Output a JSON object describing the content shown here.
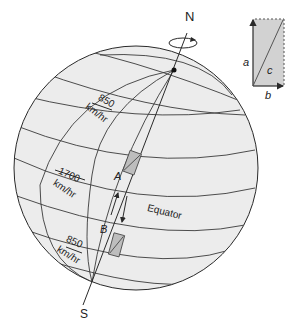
{
  "diagram": {
    "poles": {
      "north": "N",
      "south": "S"
    },
    "equator_label": "Equator",
    "speeds": [
      {
        "value": "850",
        "unit": "km/hr",
        "position": "northern-latitude"
      },
      {
        "value": "1700",
        "unit": "km/hr",
        "position": "equator"
      },
      {
        "value": "850",
        "unit": "km/hr",
        "position": "southern-latitude"
      }
    ],
    "points": [
      {
        "label": "A",
        "position": "north-of-equator"
      },
      {
        "label": "B",
        "position": "south-of-equator"
      }
    ],
    "vector_inset": {
      "labels": {
        "a": "a",
        "b": "b",
        "c": "c"
      }
    },
    "colors": {
      "globe_fill": "#ececec",
      "line": "#2a2a2a",
      "box_fill": "#bdbdbd",
      "inset_fill": "#d2d2d2"
    }
  }
}
